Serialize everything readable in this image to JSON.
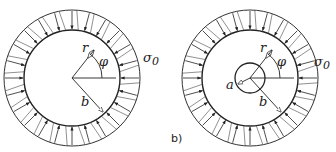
{
  "figures": [
    {
      "id": "a",
      "caption": "",
      "labels": {
        "r": "r",
        "phi": "φ",
        "b": "b",
        "sigma": "σ",
        "sigma_sub": "0"
      },
      "has_hole": false
    },
    {
      "id": "b",
      "caption": "b)",
      "labels": {
        "r": "r",
        "phi": "φ",
        "b": "b",
        "a": "a",
        "sigma": "σ",
        "sigma_sub": "0"
      },
      "has_hole": true
    }
  ],
  "load_arrow_count": 24
}
